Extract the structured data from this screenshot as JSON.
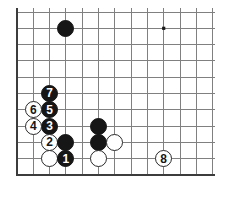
{
  "diagram": {
    "type": "go-board",
    "board": {
      "columns": 13,
      "rows": 11,
      "cell_size": 16.3,
      "origin_x": 17,
      "origin_y": 12,
      "line_color": "#808080",
      "border_color": "#3c3c3c",
      "background_color": "#ffffff",
      "star_point_color": "#1a1a1a",
      "star_points": [
        {
          "col": 9,
          "row": 1
        },
        {
          "col": 9,
          "row": 9
        }
      ]
    },
    "colors": {
      "black_stone": "#161616",
      "white_stone": "#ffffff",
      "white_stone_outline": "#2a2a2a",
      "black_label": "#ffffff",
      "white_label": "#161616"
    },
    "stones": [
      {
        "col": 3,
        "row": 1,
        "color": "black",
        "label": ""
      },
      {
        "col": 2,
        "row": 5,
        "color": "black",
        "label": "7"
      },
      {
        "col": 2,
        "row": 6,
        "color": "black",
        "label": "5"
      },
      {
        "col": 1,
        "row": 6,
        "color": "white",
        "label": "6"
      },
      {
        "col": 2,
        "row": 7,
        "color": "black",
        "label": "3"
      },
      {
        "col": 1,
        "row": 7,
        "color": "white",
        "label": "4"
      },
      {
        "col": 2,
        "row": 8,
        "color": "white",
        "label": "2"
      },
      {
        "col": 3,
        "row": 8,
        "color": "black",
        "label": ""
      },
      {
        "col": 2,
        "row": 9,
        "color": "white",
        "label": ""
      },
      {
        "col": 3,
        "row": 9,
        "color": "black",
        "label": "1"
      },
      {
        "col": 5,
        "row": 7,
        "color": "black",
        "label": ""
      },
      {
        "col": 5,
        "row": 8,
        "color": "black",
        "label": ""
      },
      {
        "col": 6,
        "row": 8,
        "color": "white",
        "label": ""
      },
      {
        "col": 5,
        "row": 9,
        "color": "white",
        "label": ""
      },
      {
        "col": 9,
        "row": 9,
        "color": "white",
        "label": "8"
      }
    ]
  }
}
